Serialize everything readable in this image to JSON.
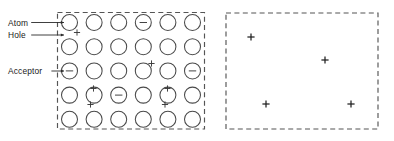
{
  "figure": {
    "title": "",
    "panels": [
      {
        "id": "left-panel",
        "name": "semiconductor-lattice-panel",
        "box": {
          "x": 57.5,
          "y": 12.5,
          "width": 147,
          "height": 116.5
        },
        "border_style": "dashed",
        "labels": [
          {
            "text": "Atom",
            "x": 8,
            "y": 22.5,
            "leader_to_x": 64,
            "leader_to_y": 22.5,
            "target": "atom-circle-r1c1"
          },
          {
            "text": "Hole",
            "x": 8,
            "y": 35,
            "leader_to_x": 64,
            "leader_to_y": 35,
            "target": "hole-plus-r2c1"
          },
          {
            "text": "Acceptor",
            "x": 8,
            "y": 71,
            "leader_to_x": 64,
            "leader_to_y": 71,
            "target": "acceptor-circle-r3c1"
          }
        ],
        "grid": {
          "rows": 5,
          "cols": 6,
          "origin_x": 69.5,
          "origin_y": 22.5,
          "step_x": 24.6,
          "step_y": 24.2,
          "radius": 8.0
        },
        "charged_atoms": [
          {
            "row": 1,
            "col": 4,
            "charge": "minus",
            "name": "ionized-donor-r1c4"
          },
          {
            "row": 3,
            "col": 1,
            "charge": "minus",
            "name": "acceptor-circle-r3c1"
          },
          {
            "row": 3,
            "col": 6,
            "charge": "minus",
            "name": "ionized-acceptor-r3c6"
          },
          {
            "row": 4,
            "col": 3,
            "charge": "minus",
            "name": "ionized-acceptor-r4c3"
          }
        ],
        "holes": [
          {
            "name": "hole-plus-r2c1",
            "x": 77,
            "y": 32.5
          },
          {
            "name": "hole-plus-r3c4",
            "x": 151.5,
            "y": 63.5
          },
          {
            "name": "hole-plus-r4c2",
            "x": 93.5,
            "y": 88.5
          },
          {
            "name": "hole-plus-r4c5",
            "x": 167.5,
            "y": 88.5
          },
          {
            "name": "hole-plus-r5c2",
            "x": 90.5,
            "y": 104.5
          },
          {
            "name": "hole-plus-r5c5",
            "x": 165,
            "y": 104.5
          }
        ],
        "hole_size": 3.1
      },
      {
        "id": "right-panel",
        "name": "free-holes-panel",
        "box": {
          "x": 226,
          "y": 13,
          "width": 152,
          "height": 116
        },
        "border_style": "dashed",
        "labels": [],
        "holes": [
          {
            "name": "free-hole-1",
            "x": 251,
            "y": 37
          },
          {
            "name": "free-hole-2",
            "x": 325,
            "y": 60
          },
          {
            "name": "free-hole-3",
            "x": 266,
            "y": 104
          },
          {
            "name": "free-hole-4",
            "x": 351,
            "y": 104
          }
        ],
        "hole_size": 3.6
      }
    ],
    "legend_terms": [
      "Atom",
      "Hole",
      "Acceptor"
    ],
    "colors": {
      "background": "#ffffff",
      "circle_stroke": "#4a4a4a",
      "box_stroke": "#555555",
      "text": "#1a1a1a",
      "sign_stroke": "#3a3a3a"
    }
  }
}
